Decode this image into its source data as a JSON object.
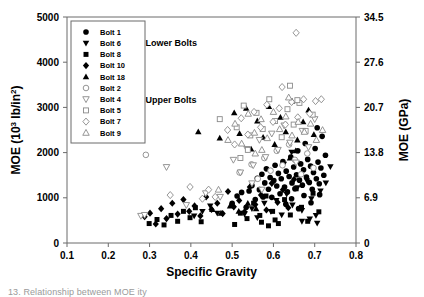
{
  "chart_data": {
    "type": "scatter",
    "title": "",
    "xlabel": "Specific Gravity",
    "ylabel": "MOE (10³ lb/in²)",
    "ylabel_right": "MOE (GPa)",
    "xlim": [
      0.1,
      0.8
    ],
    "ylim": [
      0,
      5000
    ],
    "ylim_right": [
      0,
      34.5
    ],
    "xticks": [
      "0.1",
      "0.2",
      "0.3",
      "0.4",
      "0.5",
      "0.6",
      "0.7",
      "0.8"
    ],
    "xtick_values": [
      0.1,
      0.2,
      0.3,
      0.4,
      0.5,
      0.6,
      0.7,
      0.8
    ],
    "yticks": [
      "0",
      "1000",
      "2000",
      "3000",
      "4000",
      "5000"
    ],
    "ytick_values": [
      0,
      1000,
      2000,
      3000,
      4000,
      5000
    ],
    "yticks_right": [
      "0",
      "6.9",
      "13.8",
      "20.7",
      "27.6",
      "34.5"
    ],
    "ytick_right_values": [
      0,
      6.9,
      13.8,
      20.7,
      27.6,
      34.5
    ],
    "grid": false,
    "legend_position": "top-left-inside",
    "annotations": [
      {
        "text": "Lower Bolts",
        "x": 0.29,
        "y": 4350
      },
      {
        "text": "Upper Bolts",
        "x": 0.29,
        "y": 3100
      }
    ],
    "series": [
      {
        "name": "Bolt 1",
        "marker": "circle",
        "fill": "filled",
        "group": "Lower Bolts",
        "points": [
          [
            0.523,
            1120
          ],
          [
            0.548,
            1270
          ],
          [
            0.556,
            960
          ],
          [
            0.561,
            1430
          ],
          [
            0.566,
            1180
          ],
          [
            0.572,
            1520
          ],
          [
            0.575,
            1020
          ],
          [
            0.579,
            1330
          ],
          [
            0.583,
            1640
          ],
          [
            0.588,
            1190
          ],
          [
            0.592,
            1450
          ],
          [
            0.596,
            1010
          ],
          [
            0.601,
            1380
          ],
          [
            0.604,
            1720
          ],
          [
            0.608,
            1260
          ],
          [
            0.612,
            1540
          ],
          [
            0.616,
            1090
          ],
          [
            0.619,
            1420
          ],
          [
            0.623,
            1800
          ],
          [
            0.627,
            1240
          ],
          [
            0.631,
            1590
          ],
          [
            0.634,
            1130
          ],
          [
            0.638,
            1470
          ],
          [
            0.642,
            1900
          ],
          [
            0.645,
            1330
          ],
          [
            0.649,
            1680
          ],
          [
            0.652,
            1200
          ],
          [
            0.656,
            1510
          ],
          [
            0.659,
            2040
          ],
          [
            0.663,
            1390
          ],
          [
            0.666,
            1750
          ],
          [
            0.67,
            1280
          ],
          [
            0.673,
            1620
          ],
          [
            0.677,
            2200
          ],
          [
            0.68,
            1460
          ],
          [
            0.683,
            1850
          ],
          [
            0.687,
            1340
          ],
          [
            0.69,
            1700
          ],
          [
            0.694,
            1190
          ],
          [
            0.697,
            1560
          ],
          [
            0.701,
            2090
          ],
          [
            0.704,
            1420
          ],
          [
            0.708,
            1790
          ],
          [
            0.711,
            1310
          ],
          [
            0.715,
            1660
          ],
          [
            0.718,
            2360
          ],
          [
            0.722,
            1500
          ],
          [
            0.726,
            1940
          ],
          [
            0.5,
            880
          ],
          [
            0.512,
            1040
          ],
          [
            0.534,
            790
          ],
          [
            0.541,
            1150
          ],
          [
            0.63,
            860
          ],
          [
            0.644,
            980
          ],
          [
            0.661,
            760
          ],
          [
            0.674,
            1050
          ],
          [
            0.691,
            890
          ],
          [
            0.706,
            2550
          ],
          [
            0.712,
            1070
          ]
        ]
      },
      {
        "name": "Bolt 6",
        "marker": "triangle-down",
        "fill": "filled",
        "group": "Lower Bolts",
        "points": [
          [
            0.408,
            600
          ],
          [
            0.428,
            700
          ],
          [
            0.447,
            820
          ],
          [
            0.464,
            660
          ],
          [
            0.53,
            640
          ],
          [
            0.548,
            760
          ],
          [
            0.561,
            560
          ],
          [
            0.578,
            880
          ],
          [
            0.594,
            700
          ],
          [
            0.607,
            940
          ],
          [
            0.62,
            620
          ],
          [
            0.632,
            1080
          ],
          [
            0.646,
            840
          ],
          [
            0.658,
            1220
          ],
          [
            0.669,
            720
          ],
          [
            0.681,
            1380
          ],
          [
            0.692,
            980
          ],
          [
            0.703,
            610
          ],
          [
            0.714,
            1150
          ],
          [
            0.727,
            1330
          ],
          [
            0.738,
            1690
          ],
          [
            0.669,
            480
          ],
          [
            0.688,
            530
          ],
          [
            0.706,
            440
          ],
          [
            0.625,
            1740
          ],
          [
            0.644,
            2010
          ]
        ]
      },
      {
        "name": "Bolt 8",
        "marker": "square",
        "fill": "filled",
        "group": "Lower Bolts",
        "points": [
          [
            0.299,
            430
          ],
          [
            0.318,
            520
          ],
          [
            0.335,
            400
          ],
          [
            0.352,
            610
          ],
          [
            0.368,
            480
          ],
          [
            0.382,
            700
          ],
          [
            0.398,
            560
          ],
          [
            0.411,
            780
          ],
          [
            0.425,
            470
          ],
          [
            0.506,
            410
          ],
          [
            0.52,
            660
          ],
          [
            0.536,
            540
          ],
          [
            0.552,
            880
          ],
          [
            0.567,
            610
          ],
          [
            0.582,
            1040
          ],
          [
            0.598,
            700
          ],
          [
            0.612,
            430
          ],
          [
            0.627,
            960
          ],
          [
            0.641,
            620
          ],
          [
            0.655,
            1200
          ],
          [
            0.668,
            790
          ],
          [
            0.683,
            480
          ],
          [
            0.696,
            1100
          ],
          [
            0.71,
            690
          ],
          [
            0.571,
            460
          ],
          [
            0.588,
            380
          ],
          [
            0.604,
            510
          ]
        ]
      },
      {
        "name": "Bolt 10",
        "marker": "diamond",
        "fill": "filled",
        "group": "Lower Bolts",
        "points": [
          [
            0.288,
            580
          ],
          [
            0.301,
            660
          ],
          [
            0.315,
            420
          ],
          [
            0.328,
            760
          ],
          [
            0.341,
            540
          ],
          [
            0.355,
            880
          ],
          [
            0.368,
            640
          ],
          [
            0.382,
            960
          ],
          [
            0.396,
            700
          ],
          [
            0.409,
            820
          ],
          [
            0.423,
            600
          ],
          [
            0.437,
            1020
          ],
          [
            0.45,
            740
          ],
          [
            0.464,
            880
          ],
          [
            0.477,
            650
          ],
          [
            0.49,
            1140
          ],
          [
            0.504,
            800
          ],
          [
            0.517,
            940
          ],
          [
            0.53,
            690
          ],
          [
            0.543,
            1240
          ],
          [
            0.556,
            850
          ],
          [
            0.57,
            1060
          ],
          [
            0.583,
            730
          ],
          [
            0.596,
            1320
          ],
          [
            0.61,
            900
          ],
          [
            0.623,
            1180
          ],
          [
            0.636,
            780
          ],
          [
            0.65,
            1410
          ]
        ]
      },
      {
        "name": "Bolt 18",
        "marker": "triangle-up",
        "fill": "filled",
        "group": "Lower Bolts",
        "points": [
          [
            0.418,
            2460
          ],
          [
            0.47,
            2320
          ],
          [
            0.505,
            2880
          ],
          [
            0.518,
            2420
          ],
          [
            0.534,
            2980
          ],
          [
            0.546,
            2080
          ],
          [
            0.561,
            2700
          ],
          [
            0.575,
            2340
          ],
          [
            0.589,
            3020
          ],
          [
            0.603,
            2180
          ],
          [
            0.617,
            2780
          ],
          [
            0.63,
            2460
          ],
          [
            0.645,
            3140
          ],
          [
            0.658,
            2280
          ],
          [
            0.672,
            2680
          ],
          [
            0.685,
            2940
          ],
          [
            0.698,
            2400
          ],
          [
            0.452,
            740
          ],
          [
            0.473,
            660
          ],
          [
            0.495,
            820
          ],
          [
            0.516,
            700
          ],
          [
            0.538,
            880
          ],
          [
            0.558,
            760
          ],
          [
            0.64,
            1880
          ],
          [
            0.654,
            2040
          ]
        ]
      },
      {
        "name": "Bolt 2",
        "marker": "circle",
        "fill": "open",
        "group": "Upper Bolts",
        "points": [
          [
            0.291,
            1950
          ],
          [
            0.518,
            1560
          ],
          [
            0.547,
            1740
          ],
          [
            0.562,
            1420
          ],
          [
            0.578,
            1880
          ],
          [
            0.593,
            1600
          ],
          [
            0.608,
            2040
          ],
          [
            0.622,
            1720
          ],
          [
            0.638,
            2180
          ],
          [
            0.652,
            1840
          ],
          [
            0.667,
            1520
          ],
          [
            0.682,
            1980
          ],
          [
            0.697,
            1660
          ]
        ]
      },
      {
        "name": "Bolt 4",
        "marker": "triangle-down",
        "fill": "open",
        "group": "Upper Bolts",
        "points": [
          [
            0.279,
            600
          ],
          [
            0.288,
            620
          ],
          [
            0.341,
            1680
          ],
          [
            0.389,
            840
          ],
          [
            0.436,
            1100
          ],
          [
            0.471,
            1020
          ],
          [
            0.503,
            1840
          ],
          [
            0.52,
            1560
          ],
          [
            0.536,
            2080
          ],
          [
            0.551,
            1720
          ],
          [
            0.566,
            2280
          ],
          [
            0.581,
            1900
          ],
          [
            0.596,
            2420
          ],
          [
            0.611,
            2060
          ],
          [
            0.626,
            2600
          ],
          [
            0.64,
            2220
          ],
          [
            0.655,
            1780
          ],
          [
            0.67,
            2480
          ],
          [
            0.685,
            2120
          ],
          [
            0.7,
            2740
          ],
          [
            0.548,
            1320
          ],
          [
            0.572,
            1180
          ]
        ]
      },
      {
        "name": "Bolt 5",
        "marker": "square",
        "fill": "open",
        "group": "Upper Bolts",
        "points": [
          [
            0.47,
            2740
          ],
          [
            0.511,
            2560
          ],
          [
            0.528,
            3040
          ],
          [
            0.544,
            2380
          ],
          [
            0.559,
            2880
          ],
          [
            0.574,
            2520
          ],
          [
            0.59,
            3180
          ],
          [
            0.604,
            2700
          ],
          [
            0.62,
            2340
          ],
          [
            0.634,
            2960
          ],
          [
            0.649,
            2620
          ],
          [
            0.663,
            3100
          ],
          [
            0.678,
            2480
          ],
          [
            0.64,
            3480
          ],
          [
            0.658,
            3160
          ],
          [
            0.695,
            2840
          ],
          [
            0.52,
            1880
          ],
          [
            0.538,
            2060
          ]
        ]
      },
      {
        "name": "Bolt 7",
        "marker": "diamond",
        "fill": "open",
        "group": "Upper Bolts",
        "points": [
          [
            0.655,
            4650
          ],
          [
            0.621,
            3450
          ],
          [
            0.35,
            1060
          ],
          [
            0.398,
            1240
          ],
          [
            0.428,
            980
          ],
          [
            0.443,
            1180
          ],
          [
            0.459,
            1020
          ],
          [
            0.489,
            2500
          ],
          [
            0.506,
            2180
          ],
          [
            0.522,
            2760
          ],
          [
            0.538,
            2400
          ],
          [
            0.553,
            2900
          ],
          [
            0.569,
            2560
          ],
          [
            0.584,
            3060
          ],
          [
            0.599,
            2680
          ],
          [
            0.614,
            2980
          ],
          [
            0.629,
            2620
          ],
          [
            0.644,
            3120
          ],
          [
            0.659,
            2780
          ],
          [
            0.673,
            3180
          ],
          [
            0.688,
            2860
          ],
          [
            0.702,
            3140
          ],
          [
            0.716,
            3180
          ]
        ]
      },
      {
        "name": "Bolt 9",
        "marker": "triangle-up",
        "fill": "open",
        "group": "Upper Bolts",
        "points": [
          [
            0.637,
            3220
          ],
          [
            0.467,
            1180
          ],
          [
            0.49,
            2280
          ],
          [
            0.507,
            2640
          ],
          [
            0.523,
            2200
          ],
          [
            0.539,
            2860
          ],
          [
            0.554,
            2440
          ],
          [
            0.57,
            2740
          ],
          [
            0.585,
            2320
          ],
          [
            0.6,
            2900
          ],
          [
            0.615,
            2520
          ],
          [
            0.63,
            2800
          ],
          [
            0.645,
            2380
          ],
          [
            0.66,
            2680
          ],
          [
            0.675,
            2460
          ],
          [
            0.69,
            2640
          ],
          [
            0.704,
            2280
          ],
          [
            0.719,
            2500
          ],
          [
            0.556,
            1980
          ],
          [
            0.572,
            2060
          ]
        ]
      }
    ]
  },
  "legend": {
    "entries": [
      {
        "label": "Bolt 1",
        "marker": "circle",
        "fill": "filled"
      },
      {
        "label": "Bolt 6",
        "marker": "triangle-down",
        "fill": "filled"
      },
      {
        "label": "Bolt 8",
        "marker": "square",
        "fill": "filled"
      },
      {
        "label": "Bolt 10",
        "marker": "diamond",
        "fill": "filled"
      },
      {
        "label": "Bolt 18",
        "marker": "triangle-up",
        "fill": "filled"
      },
      {
        "label": "Bolt 2",
        "marker": "circle",
        "fill": "open"
      },
      {
        "label": "Bolt 4",
        "marker": "triangle-down",
        "fill": "open"
      },
      {
        "label": "Bolt 5",
        "marker": "square",
        "fill": "open"
      },
      {
        "label": "Bolt 7",
        "marker": "diamond",
        "fill": "open"
      },
      {
        "label": "Bolt 9",
        "marker": "triangle-up",
        "fill": "open"
      }
    ]
  },
  "caption": {
    "text": "13.  Relationship between MOE                    ity",
    "color": "#9a9a9a"
  },
  "colors": {
    "marker_filled": "#000000",
    "marker_open_stroke": "#8a8a8a",
    "axis": "#6b6b6b",
    "text": "#000000",
    "background": "#ffffff"
  }
}
